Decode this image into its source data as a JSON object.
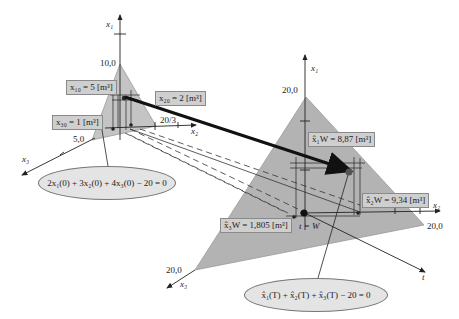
{
  "diagram": {
    "left_simplex": {
      "axes": {
        "x1": "x₁",
        "x2": "x₂",
        "x3": "x₃"
      },
      "ticks": {
        "x1": "10,0",
        "x2": "20/3",
        "x3": "5,0"
      },
      "labels": {
        "x10": "x₁₀ = 5 [m³]",
        "x20": "x₂₀ = 2 [m³]",
        "x30": "x₃₀ = 1 [m³]"
      },
      "constraint": "2x₁(0) + 3x₂(0) + 4x₃(0) − 20 = 0"
    },
    "right_simplex": {
      "axes": {
        "x1": "x₁",
        "x2": "x₂",
        "x3": "x₃",
        "t": "t"
      },
      "ticks": {
        "x1": "20,0",
        "x2": "20,0",
        "x3": "20,0"
      },
      "labels": {
        "x1W": "x̂₁W = 8,87 [m³]",
        "x2W": "x̂₂W = 9,34 [m³]",
        "x3W": "x̂₃W = 1,805 [m³]",
        "tW": "t = W"
      },
      "constraint": "x̂₁(T) + x̂₂(T) + x̂₃(T) − 20 = 0"
    },
    "colors": {
      "simplex_fill": "#b3b3b3",
      "label_box": "#cfcfcf",
      "ellipse_fill": "#e4e4e4",
      "trajectory": "#111111"
    }
  }
}
